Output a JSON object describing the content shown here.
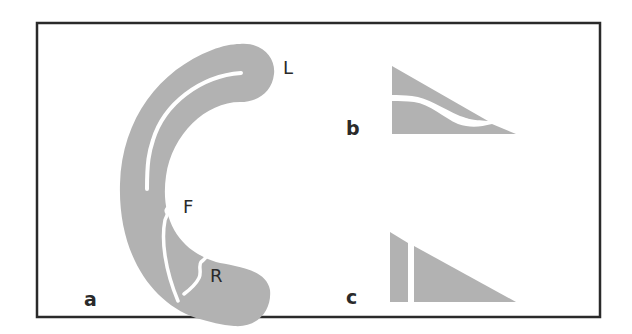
{
  "figure": {
    "colors": {
      "frame": "#2a2a2a",
      "shape_fill": "#b2b2b2",
      "gap": "#ffffff",
      "background": "#ffffff"
    },
    "panels": [
      {
        "id": "a",
        "label": "a",
        "description": "C-shaped band with a white tear, labeled L, F and R",
        "point_labels": {
          "L": "L",
          "F": "F",
          "R": "R"
        }
      },
      {
        "id": "b",
        "label": "b",
        "description": "Right-triangle wedge split by a wavy white line"
      },
      {
        "id": "c",
        "label": "c",
        "description": "Right-triangle wedge split by a vertical white gap"
      }
    ]
  }
}
